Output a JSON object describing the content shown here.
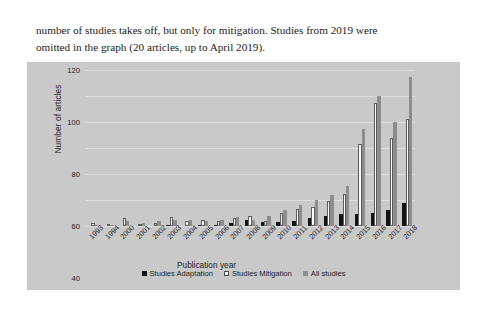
{
  "document": {
    "paragraph_lines": [
      "number of studies takes off, but only for mitigation. Studies from 2019 were",
      "omitted in the graph (20 articles, up to April 2019)."
    ]
  },
  "chart_data": {
    "type": "bar",
    "title": "",
    "xlabel": "Publication year",
    "ylabel": "Number of articles",
    "ylim": [
      0,
      120
    ],
    "yticks": [
      0,
      20,
      40,
      60,
      80,
      100,
      120
    ],
    "grid": true,
    "legend_position": "bottom",
    "categories": [
      "1993",
      "1994",
      "2000",
      "2001",
      "2002",
      "2003",
      "2004",
      "2005",
      "2006",
      "2007",
      "2008",
      "2009",
      "2010",
      "2011",
      "2012",
      "2013",
      "2014",
      "2015",
      "2016",
      "2017",
      "2018"
    ],
    "series": [
      {
        "name": "Studies Adaptation",
        "color": "#131313",
        "values": [
          0,
          0,
          0,
          0,
          0,
          1,
          0,
          1,
          1,
          2,
          5,
          3,
          3,
          4,
          6,
          8,
          9,
          9,
          10,
          12,
          18
        ]
      },
      {
        "name": "Studies Mitigation",
        "color": "#fbfbfb",
        "values": [
          2,
          0,
          6,
          1,
          2,
          7,
          4,
          5,
          4,
          6,
          8,
          4,
          10,
          13,
          15,
          19,
          25,
          63,
          95,
          68,
          82
        ]
      },
      {
        "name": "All studies",
        "color": "#8d8d8d",
        "values": [
          1,
          1,
          4,
          2,
          4,
          5,
          5,
          4,
          5,
          7,
          5,
          8,
          12,
          16,
          20,
          24,
          31,
          75,
          100,
          80,
          115
        ]
      }
    ]
  },
  "legend": {
    "items": [
      {
        "label": "Studies Adaptation"
      },
      {
        "label": "Studies Mitigation"
      },
      {
        "label": "All studies"
      }
    ]
  },
  "colors": {
    "panel_background": "#c9c9c9",
    "gridline": "#dedede",
    "page_background": "#ffffff"
  }
}
